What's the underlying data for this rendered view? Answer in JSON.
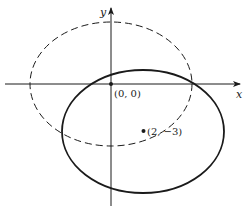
{
  "figure": {
    "type": "ellipse-translation-diagram",
    "axes": {
      "x_label": "x",
      "y_label": "y"
    },
    "origin": {
      "label": "(0, 0)",
      "x": 0,
      "y": 0
    },
    "shifted_center": {
      "label": "(2, −3)",
      "x": 2,
      "y": -3
    },
    "curves": [
      {
        "name": "original-ellipse",
        "style": "dashed",
        "center": [
          0,
          0
        ],
        "rx_units": 5,
        "ry_units": 3.85
      },
      {
        "name": "translated-ellipse",
        "style": "solid",
        "center": [
          2,
          -3
        ],
        "rx_units": 5,
        "ry_units": 3.85
      }
    ],
    "colors": {
      "ink": "#1a1a1a",
      "background": "#ffffff"
    }
  }
}
